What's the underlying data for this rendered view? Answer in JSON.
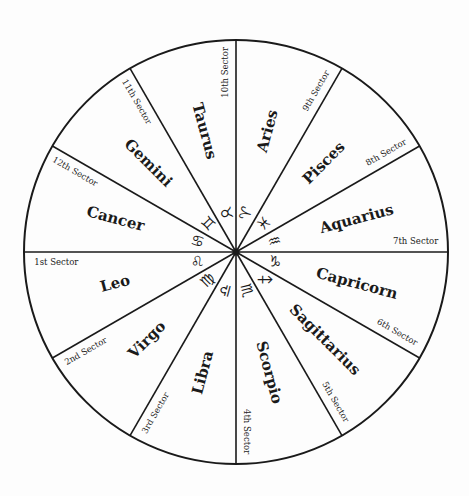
{
  "diagram": {
    "type": "zodiac-wheel",
    "center": {
      "x": 236,
      "y": 252
    },
    "radius": 212,
    "line_color": "#1a1a1a",
    "background": "#fdfdfd",
    "segments": [
      {
        "sign": "Leo",
        "glyph": "♌",
        "sector": "1st Sector",
        "mid_angle": 195
      },
      {
        "sign": "Virgo",
        "glyph": "♍",
        "sector": "2nd Sector",
        "mid_angle": 225
      },
      {
        "sign": "Libra",
        "glyph": "♎",
        "sector": "3rd Sector",
        "mid_angle": 255
      },
      {
        "sign": "Scorpio",
        "glyph": "♏",
        "sector": "4th Sector",
        "mid_angle": 285
      },
      {
        "sign": "Sagittarius",
        "glyph": "♐",
        "sector": "5th Sector",
        "mid_angle": 315
      },
      {
        "sign": "Capricorn",
        "glyph": "♑",
        "sector": "6th Sector",
        "mid_angle": 345
      },
      {
        "sign": "Aquarius",
        "glyph": "♒",
        "sector": "7th Sector",
        "mid_angle": 15
      },
      {
        "sign": "Pisces",
        "glyph": "♓",
        "sector": "8th Sector",
        "mid_angle": 45
      },
      {
        "sign": "Aries",
        "glyph": "♈",
        "sector": "9th Sector",
        "mid_angle": 75
      },
      {
        "sign": "Taurus",
        "glyph": "♉",
        "sector": "10th Sector",
        "mid_angle": 105
      },
      {
        "sign": "Gemini",
        "glyph": "♊",
        "sector": "11th Sector",
        "mid_angle": 135
      },
      {
        "sign": "Cancer",
        "glyph": "♋",
        "sector": "12th Sector",
        "mid_angle": 165
      }
    ]
  }
}
